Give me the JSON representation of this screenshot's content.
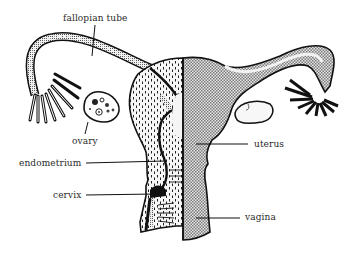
{
  "diagram": {
    "labels": {
      "fallopian_tube": "fallopian tube",
      "ovary": "ovary",
      "endometrium": "endometrium",
      "cervix": "cervix",
      "uterus": "uterus",
      "vagina": "vagina"
    },
    "colors": {
      "background": "#ffffff",
      "ink": "#111111",
      "label_text": "#2a2a2a",
      "stipple_fill": "#cfcfcf",
      "light_fill": "#efefef"
    }
  }
}
